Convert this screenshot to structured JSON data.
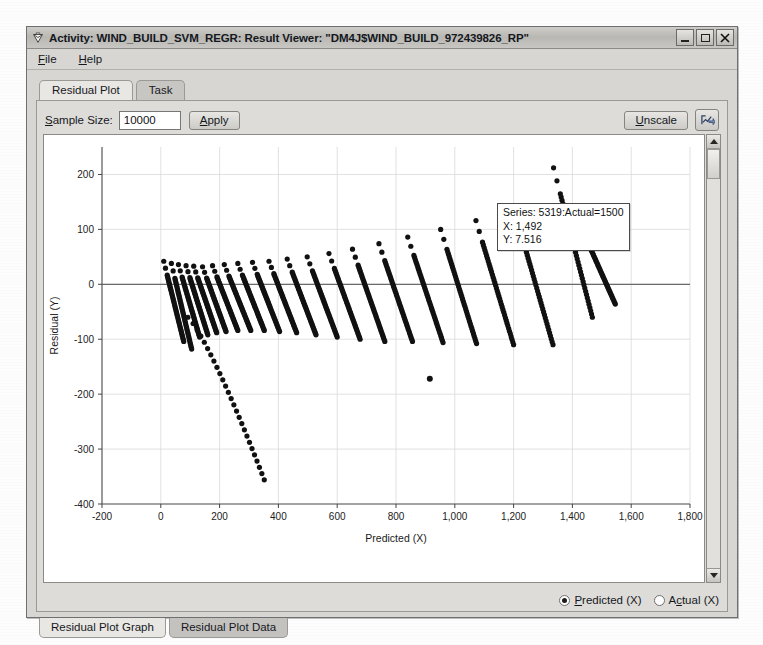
{
  "window": {
    "title": "Activity: WIND_BUILD_SVM_REGR: Result Viewer: \"DM4J$WIND_BUILD_972439826_RP\"",
    "icon": "diamond-app-icon",
    "minimize_label": "",
    "maximize_label": "",
    "close_label": "✕"
  },
  "menubar": {
    "items": [
      {
        "label": "File",
        "mnemonic": "F"
      },
      {
        "label": "Help",
        "mnemonic": "H"
      }
    ]
  },
  "tabs": {
    "items": [
      {
        "label": "Residual Plot",
        "active": true
      },
      {
        "label": "Task",
        "active": false
      }
    ]
  },
  "toolbar": {
    "sample_size_label": "Sample Size:",
    "sample_size_value": "10000",
    "apply_label": "Apply",
    "unscale_label": "Unscale",
    "export_icon": "chart-export-icon"
  },
  "tooltip": {
    "series": "Series: 5319:Actual=1500",
    "x": "X: 1,492",
    "y": "Y: 7.516"
  },
  "radios": {
    "options": [
      {
        "label": "Predicted (X)",
        "selected": true
      },
      {
        "label": "Actual (X)",
        "selected": false
      }
    ]
  },
  "bottom_tabs": {
    "items": [
      {
        "label": "Residual Plot Graph",
        "active": true
      },
      {
        "label": "Residual Plot Data",
        "active": false
      }
    ]
  },
  "scrollbar": {
    "up_arrow": "scroll-up-icon",
    "down_arrow": "scroll-down-icon"
  },
  "chart_data": {
    "type": "scatter",
    "title": "",
    "xlabel": "Predicted (X)",
    "ylabel": "Residual (Y)",
    "xlim": [
      -200,
      1800
    ],
    "ylim": [
      -400,
      250
    ],
    "xticks": [
      -200,
      0,
      200,
      400,
      600,
      800,
      1000,
      1200,
      1400,
      1600,
      1800
    ],
    "xticklabels": [
      "-200",
      "0",
      "200",
      "400",
      "600",
      "800",
      "1,000",
      "1,200",
      "1,400",
      "1,600",
      "1,800"
    ],
    "yticks": [
      200,
      100,
      0,
      -100,
      -200,
      -300,
      -400
    ],
    "yticklabels": [
      "200",
      "100",
      "0",
      "-100",
      "-200",
      "-300",
      "-400"
    ],
    "grid": true,
    "zero_line": 0,
    "marker_color": "#111111",
    "marker_size": 2.6,
    "streaks": [
      {
        "x_start": 10,
        "x_end": 78,
        "y_start": 42,
        "y_end": -104
      },
      {
        "x_start": 36,
        "x_end": 105,
        "y_start": 38,
        "y_end": -118
      },
      {
        "x_start": 60,
        "x_end": 132,
        "y_start": 36,
        "y_end": -96
      },
      {
        "x_start": 86,
        "x_end": 160,
        "y_start": 34,
        "y_end": -92
      },
      {
        "x_start": 112,
        "x_end": 190,
        "y_start": 33,
        "y_end": -88
      },
      {
        "x_start": 142,
        "x_end": 222,
        "y_start": 32,
        "y_end": -86
      },
      {
        "x_start": 176,
        "x_end": 262,
        "y_start": 34,
        "y_end": -84
      },
      {
        "x_start": 216,
        "x_end": 306,
        "y_start": 36,
        "y_end": -84
      },
      {
        "x_start": 262,
        "x_end": 352,
        "y_start": 38,
        "y_end": -84
      },
      {
        "x_start": 312,
        "x_end": 404,
        "y_start": 40,
        "y_end": -86
      },
      {
        "x_start": 368,
        "x_end": 462,
        "y_start": 42,
        "y_end": -88
      },
      {
        "x_start": 430,
        "x_end": 528,
        "y_start": 46,
        "y_end": -92
      },
      {
        "x_start": 498,
        "x_end": 600,
        "y_start": 50,
        "y_end": -96
      },
      {
        "x_start": 572,
        "x_end": 678,
        "y_start": 56,
        "y_end": -100
      },
      {
        "x_start": 652,
        "x_end": 762,
        "y_start": 64,
        "y_end": -104
      },
      {
        "x_start": 742,
        "x_end": 856,
        "y_start": 74,
        "y_end": -104
      },
      {
        "x_start": 840,
        "x_end": 960,
        "y_start": 86,
        "y_end": -106
      },
      {
        "x_start": 952,
        "x_end": 1074,
        "y_start": 100,
        "y_end": -108
      },
      {
        "x_start": 1072,
        "x_end": 1200,
        "y_start": 116,
        "y_end": -110
      },
      {
        "x_start": 1200,
        "x_end": 1334,
        "y_start": 140,
        "y_end": -110
      },
      {
        "x_start": 1336,
        "x_end": 1468,
        "y_start": 212,
        "y_end": -60
      },
      {
        "x_start": 1436,
        "x_end": 1546,
        "y_start": 96,
        "y_end": -36
      }
    ],
    "long_tail": {
      "x_start": 92,
      "x_end": 352,
      "y_start": -60,
      "y_end": -356,
      "description": "sparse lower tail of isolated points descending to about -356 at x=350"
    },
    "outliers": [
      {
        "x": 915,
        "y": -172
      }
    ],
    "hovered_point": {
      "x": 1492,
      "y": 7.516,
      "series": "5319:Actual=1500"
    }
  }
}
